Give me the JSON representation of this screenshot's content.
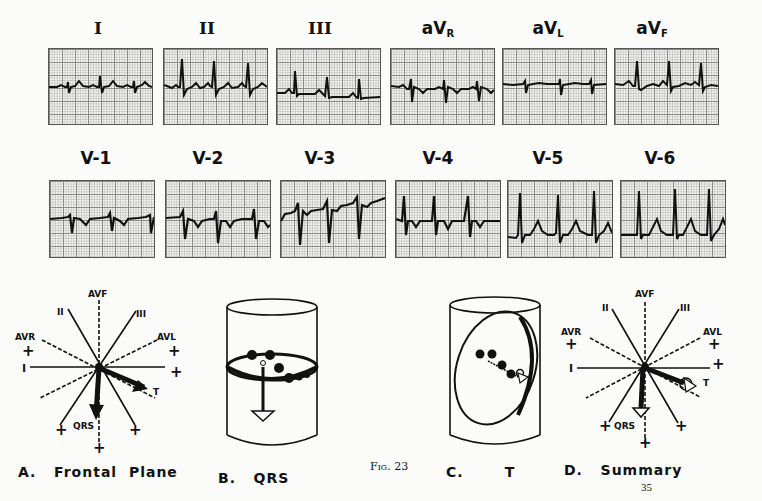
{
  "figure": {
    "number_label": "Fig. 23",
    "page_number": "35"
  },
  "limb_leads": [
    {
      "label": "I",
      "sub": ""
    },
    {
      "label": "II",
      "sub": ""
    },
    {
      "label": "III",
      "sub": ""
    },
    {
      "label": "aV",
      "sub": "R"
    },
    {
      "label": "aV",
      "sub": "L"
    },
    {
      "label": "aV",
      "sub": "F"
    }
  ],
  "precordial_leads": [
    {
      "label": "V-1"
    },
    {
      "label": "V-2"
    },
    {
      "label": "V-3"
    },
    {
      "label": "V-4"
    },
    {
      "label": "V-5"
    },
    {
      "label": "V-6"
    }
  ],
  "panels": {
    "a": {
      "caption": "A.   Frontal  Plane"
    },
    "b": {
      "caption": "B.   QRS"
    },
    "c": {
      "caption": "C.       T"
    },
    "d": {
      "caption": "D.   Summary"
    }
  },
  "axis_labels": {
    "avf": "AVF",
    "ii": "II",
    "iii": "III",
    "avr": "AVR",
    "avl": "AVL",
    "i": "I",
    "t": "T",
    "qrs": "QRS",
    "plus": "+"
  }
}
